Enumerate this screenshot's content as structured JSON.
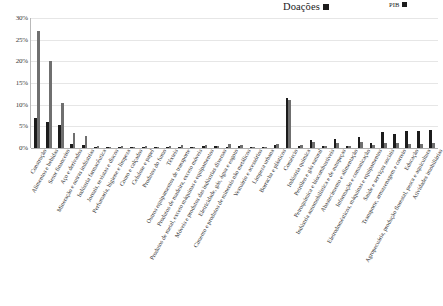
{
  "legend": {
    "donations": {
      "label": "Doações",
      "color": "#1c1c1c"
    },
    "gdp": {
      "label": "PIB",
      "color": "#6f6f6f"
    }
  },
  "chart_data": {
    "type": "bar",
    "title": "",
    "subtitle": "",
    "xlabel": "",
    "ylabel": "",
    "ylim": [
      0,
      30
    ],
    "ytick_labels": [
      "0%",
      "5%",
      "10%",
      "15%",
      "20%",
      "25%",
      "30%"
    ],
    "ytick_values": [
      0,
      5,
      10,
      15,
      20,
      25,
      30
    ],
    "grid": true,
    "legend_position": "top-right",
    "value_suffix": "%",
    "categories": [
      "Construção",
      "Alimentos e bebidas",
      "Setor financeiro",
      "Aço e derivados",
      "Mineração e outras indústrias",
      "Indústria farmacêutica",
      "Jornais, revistas e discos",
      "Perfumaria, higiene e limpeza",
      "Couro e calçados",
      "Celulose e papel",
      "Produtos do fumo",
      "Têxteis",
      "Outros equipamentos de transporte",
      "Produtos de madeira, exceto móveis",
      "Produtos de metal, exceto máquinas e equipamentos",
      "Móveis e produtos das indústrias diversas",
      "Eletricidade, gás, água e esgoto",
      "Cimento e produtos de minerais não metálicos",
      "Vestuário e acessórios",
      "Limpeza urbana",
      "Borracha e plásticos",
      "Comércio",
      "Indústria química",
      "Petróleo e gás natural",
      "Petroquímica e biocombustíveis",
      "Indústria automobilística e de autopeças",
      "Abastecimento e alimentação",
      "Informação e comunicação",
      "Eletrodomésticos, máquinas e equipamentos",
      "Saúde e serviços sociais",
      "Transporte, armazenagem e correio",
      "Educação",
      "Agropecuária, produção florestal, pesca e aquicultura",
      "Atividades imobiliárias"
    ],
    "series": [
      {
        "name": "Doações",
        "color": "#1c1c1c",
        "values": [
          7.0,
          6.1,
          5.2,
          0.9,
          0.7,
          0.25,
          0.2,
          0.2,
          0.15,
          0.2,
          0.1,
          0.2,
          0.3,
          0.15,
          0.5,
          0.35,
          0.2,
          0.4,
          0.2,
          0.15,
          0.7,
          11.6,
          0.5,
          1.9,
          0.4,
          2.1,
          0.5,
          2.6,
          1.2,
          3.6,
          3.2,
          3.9,
          4.0,
          4.2
        ]
      },
      {
        "name": "PIB",
        "color": "#6f6f6f",
        "values": [
          27.0,
          20.1,
          10.5,
          3.5,
          2.8,
          0.5,
          0.3,
          0.45,
          0.25,
          0.5,
          0.2,
          0.4,
          0.6,
          0.25,
          0.8,
          0.55,
          0.9,
          0.7,
          0.3,
          0.25,
          1.0,
          11.1,
          0.8,
          1.3,
          0.5,
          1.1,
          0.35,
          1.5,
          0.7,
          1.2,
          1.1,
          0.9,
          1.0,
          1.1
        ]
      }
    ]
  }
}
